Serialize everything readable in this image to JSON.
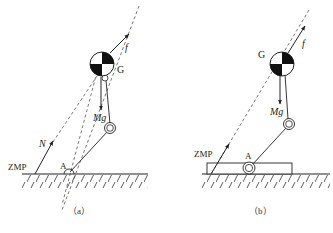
{
  "panels": [
    {
      "id": "a",
      "caption": "（a）",
      "labels": {
        "com": "G",
        "force": "f",
        "gravity": "Mg",
        "normal": "N",
        "zmp": "ZMP",
        "ankle": "A"
      }
    },
    {
      "id": "b",
      "caption": "（b）",
      "labels": {
        "com": "G",
        "force": "f",
        "gravity": "Mg",
        "zmp": "ZMP",
        "ankle": "A"
      }
    }
  ],
  "colors": {
    "line": "#222222",
    "dashed": "#555555",
    "background": "#ffffff"
  }
}
